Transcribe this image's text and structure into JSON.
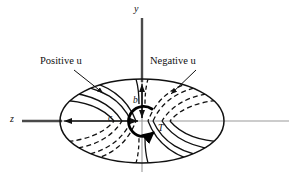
{
  "figure": {
    "background_color": "#ffffff",
    "width": 289,
    "height": 180,
    "axes": {
      "vertical": {
        "name": "y-axis",
        "label": "y",
        "color": "#555555",
        "x": 142,
        "y_top": 18,
        "y_bottom": 172
      },
      "horizontal": {
        "name": "z-axis",
        "label": "z",
        "color": "#888888",
        "y": 121,
        "x_left": 22,
        "x_right": 289
      }
    },
    "ellipse": {
      "name": "cross-section-boundary",
      "center_x": 142,
      "center_y": 121,
      "radius_x": 82,
      "radius_y": 42,
      "stroke_color": "#111111",
      "stroke_width": 1.4
    },
    "callouts": [
      {
        "id": "positive-u",
        "label": "Positive u",
        "text_x": 40,
        "text_y": 56,
        "leader_from_x": 74,
        "leader_from_y": 70,
        "leader_to_x": 103,
        "leader_to_y": 93
      },
      {
        "id": "negative-u",
        "label": "Negative u",
        "text_x": 150,
        "text_y": 56,
        "leader_from_x": 193,
        "leader_from_y": 70,
        "leader_to_x": 170,
        "leader_to_y": 94
      }
    ],
    "dimensions": [
      {
        "id": "b-dimension",
        "label": "b",
        "orientation": "vertical",
        "from_x": 142,
        "from_y": 82,
        "to_x": 142,
        "to_y": 121
      },
      {
        "id": "c-dimension",
        "label": "c",
        "orientation": "horizontal",
        "from_x": 62,
        "from_y": 121,
        "to_x": 142,
        "to_y": 121
      }
    ],
    "torque": {
      "id": "torque-arrow",
      "label": "T",
      "center_x": 142,
      "center_y": 121,
      "radius": 15,
      "stroke_color": "#000000",
      "stroke_width": 2.6,
      "direction": "counterclockwise"
    },
    "contours": {
      "solid": {
        "name": "positive-u-contours",
        "style": "solid",
        "stroke_color": "#111111",
        "quadrants": [
          "upper-left",
          "lower-right"
        ],
        "count_per_quadrant": 3
      },
      "dashed": {
        "name": "negative-u-contours",
        "style": "dashed",
        "stroke_color": "#111111",
        "quadrants": [
          "upper-right",
          "lower-left"
        ],
        "count_per_quadrant": 3,
        "dash_pattern": "5,3"
      }
    }
  }
}
